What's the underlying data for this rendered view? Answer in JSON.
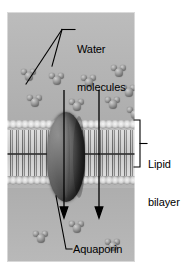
{
  "figure": {
    "type": "biology-diagram"
  },
  "labels": {
    "water_molecules": "Water\nmolecules",
    "water_molecules_line1": "Water",
    "water_molecules_line2": "molecules",
    "lipid_bilayer": "Lipid\nbilayer",
    "lipid_bilayer_line1": "Lipid",
    "lipid_bilayer_line2": "bilayer",
    "aquaporin": "Aquaporin"
  },
  "colors": {
    "panel_background": "#b9b9b9",
    "protein": "#2e2e2e",
    "water_molecule": "#8a8a8a",
    "lipid_head": "#d8d8d8",
    "lipid_tail": "#8a8a8a",
    "label_text": "#000000",
    "leader_line": "#000000",
    "page_background": "#ffffff"
  },
  "panel": {
    "x": 7,
    "y": 12,
    "width": 128,
    "height": 250
  },
  "structures": [
    {
      "name": "lipid-bilayer",
      "label": "Lipid bilayer",
      "y": 108,
      "height": 68
    },
    {
      "name": "aquaporin-channel",
      "label": "Aquaporin",
      "x": 40,
      "y": 100,
      "width": 38,
      "height": 90
    }
  ],
  "water_molecules": [
    {
      "x": 14,
      "y": 56
    },
    {
      "x": 42,
      "y": 60
    },
    {
      "x": 74,
      "y": 62
    },
    {
      "x": 104,
      "y": 52
    },
    {
      "x": 20,
      "y": 82
    },
    {
      "x": 62,
      "y": 86
    },
    {
      "x": 98,
      "y": 84
    },
    {
      "x": 114,
      "y": 72
    },
    {
      "x": 120,
      "y": 94
    },
    {
      "x": 26,
      "y": 218
    },
    {
      "x": 62,
      "y": 208
    },
    {
      "x": 98,
      "y": 226
    }
  ],
  "arrows": [
    {
      "name": "flow-arrow-left",
      "x": 57,
      "from_y": 78,
      "to_y": 205,
      "direction": "down"
    },
    {
      "name": "flow-arrow-right",
      "x": 92,
      "from_y": 78,
      "to_y": 205,
      "direction": "down"
    }
  ]
}
